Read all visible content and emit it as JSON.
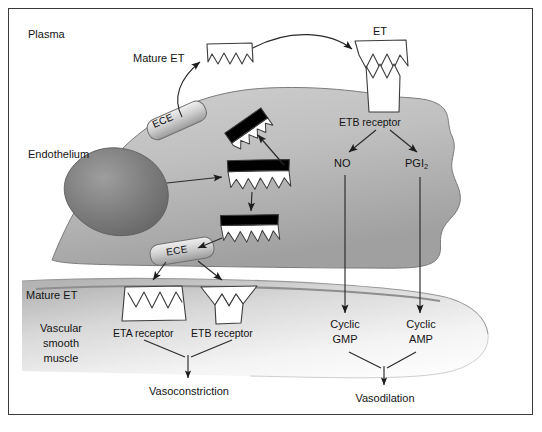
{
  "figure": {
    "type": "biological-pathway-diagram"
  },
  "compartments": {
    "plasma": "Plasma",
    "endothelium": "Endothelium",
    "smooth_muscle_line1": "Vascular",
    "smooth_muscle_line2": "smooth",
    "smooth_muscle_line3": "muscle"
  },
  "labels": {
    "mature_et_top": "Mature ET",
    "mature_et_bottom": "Mature ET",
    "et_top": "ET",
    "ece_upper": "ECE",
    "ece_lower": "ECE",
    "etb_receptor_top": "ETB receptor",
    "eta_receptor_bottom": "ETA receptor",
    "etb_receptor_bottom": "ETB receptor",
    "no": "NO",
    "pgi2_base": "PGI",
    "pgi2_sub": "2",
    "cyclic_gmp_line1": "Cyclic",
    "cyclic_gmp_line2": "GMP",
    "cyclic_amp_line1": "Cyclic",
    "cyclic_amp_line2": "AMP",
    "vasoconstriction": "Vasoconstriction",
    "vasodilation": "Vasodilation"
  },
  "colors": {
    "border": "#3a3a3a",
    "text": "#141414",
    "endothelium_light": "#d4d4d4",
    "endothelium_dark": "#a8a8a8",
    "nucleus_light": "#9a9a9a",
    "nucleus_dark": "#6e6e6e",
    "ece_light": "#e8e8e8",
    "ece_dark": "#9d9d9d",
    "muscle_light": "#f2f2f2",
    "muscle_dark": "#b9b9b9",
    "molecule_fill": "#ffffff",
    "molecule_bar": "#000000",
    "stroke": "#4a4a4a"
  },
  "icons": {
    "mature_et": "zigzag-peptide-icon",
    "big_et": "black-bar-zigzag-precursor-icon",
    "ece_enzyme": "ece-enzyme-bar-icon",
    "receptor": "receptor-trapezoid-icon",
    "nucleus": "cell-nucleus-icon",
    "arrow": "arrow-icon"
  }
}
